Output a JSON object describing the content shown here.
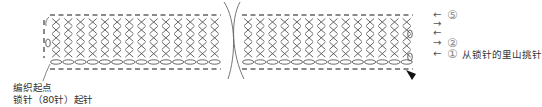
{
  "diagram": {
    "type": "crochet-chart",
    "stitch": "single-crochet",
    "rows": 5,
    "colors": {
      "stitch_line": "#555555",
      "dash": "#8a8a8a",
      "text": "#333333",
      "circle": "#777777"
    }
  },
  "annotations": {
    "start_point": "编织起点",
    "chain_start": "锁针（80针）起针"
  },
  "row_markers": [
    {
      "row": 5,
      "number": "⑤",
      "direction": "left",
      "note": ""
    },
    {
      "row": 4,
      "number": "",
      "direction": "right",
      "note": ""
    },
    {
      "row": 3,
      "number": "",
      "direction": "left",
      "note": ""
    },
    {
      "row": 2,
      "number": "②",
      "direction": "right",
      "note": ""
    },
    {
      "row": 1,
      "number": "①",
      "direction": "left",
      "note": "从锁针的里山挑针"
    }
  ]
}
